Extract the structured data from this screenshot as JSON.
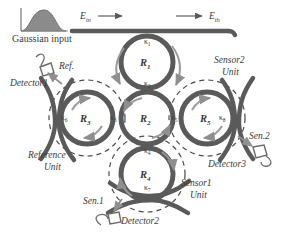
{
  "figure": {
    "type": "photonic-ring-resonator-schematic",
    "colors": {
      "waveguide": "#5a5a5a",
      "dashed_boundary": "#4a4a4a",
      "arrow": "#9a9a9a",
      "text": "#3a3a3a",
      "gaussian_fill": "#7c7c7c",
      "background": "#ffffff"
    },
    "input_source": {
      "caption": "Gaussian input",
      "waveform": "gaussian-curve"
    },
    "ports": [
      {
        "name": "input-port",
        "label": "E",
        "subscript": "in",
        "direction": "right"
      },
      {
        "name": "through-port",
        "label": "E",
        "subscript": "th",
        "direction": "right"
      }
    ],
    "rings": [
      {
        "id": "R1",
        "label": "R",
        "subscript": "1",
        "cx": 147,
        "cy": 62,
        "r": 30
      },
      {
        "id": "R2",
        "label": "R",
        "subscript": "2",
        "cx": 147,
        "cy": 118,
        "r": 30
      },
      {
        "id": "R3",
        "label": "R",
        "subscript": "3",
        "cx": 87,
        "cy": 118,
        "r": 30
      },
      {
        "id": "R4",
        "label": "R",
        "subscript": "4",
        "cx": 147,
        "cy": 174,
        "r": 30
      },
      {
        "id": "R5",
        "label": "R",
        "subscript": "5",
        "cx": 207,
        "cy": 118,
        "r": 30
      }
    ],
    "couplings": [
      {
        "id": "k1",
        "label": "κ",
        "subscript": "1",
        "x": 150,
        "y": 40,
        "desc": "bus-to-R1"
      },
      {
        "id": "k2",
        "label": "κ",
        "subscript": "2",
        "x": 150,
        "y": 85,
        "desc": "R1-to-R2"
      },
      {
        "id": "k3",
        "label": "κ",
        "subscript": "3",
        "x": 120,
        "y": 117,
        "desc": "R3-to-R2"
      },
      {
        "id": "k4",
        "label": "κ",
        "subscript": "4",
        "x": 150,
        "y": 150,
        "desc": "R2-to-R4"
      },
      {
        "id": "k5",
        "label": "κ",
        "subscript": "5",
        "x": 176,
        "y": 117,
        "desc": "R2-to-R5"
      },
      {
        "id": "k6",
        "label": "κ",
        "subscript": "6",
        "x": 63,
        "y": 117,
        "desc": "R3-to-reference-bus"
      },
      {
        "id": "k7",
        "label": "κ",
        "subscript": "7",
        "x": 150,
        "y": 196,
        "desc": "R4-to-sensor1-bus"
      },
      {
        "id": "k8",
        "label": "κ",
        "subscript": "8",
        "x": 226,
        "y": 117,
        "desc": "R5-to-sensor2-bus"
      }
    ],
    "units": [
      {
        "id": "reference-unit",
        "line1": "Reference",
        "line2": "Unit"
      },
      {
        "id": "sensor1-unit",
        "line1": "Sensor1",
        "line2": "Unit"
      },
      {
        "id": "sensor2-unit",
        "line1": "Sensor2",
        "line2": "Unit"
      }
    ],
    "detectors": [
      {
        "id": "detector1",
        "label": "Detector1",
        "signal": "Ref."
      },
      {
        "id": "detector2",
        "label": "Detector2",
        "signal": "Sen.1"
      },
      {
        "id": "detector3",
        "label": "Detector3",
        "signal": "Sen.2"
      }
    ]
  }
}
